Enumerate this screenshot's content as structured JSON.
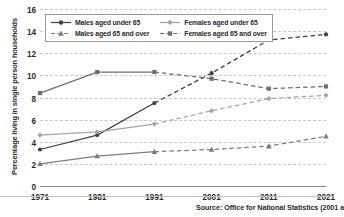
{
  "chart_data": {
    "type": "line",
    "title": "",
    "xlabel": "",
    "ylabel": "Percentage living in single person households",
    "categories": [
      "1971",
      "1981",
      "1991",
      "2001",
      "2011",
      "2021"
    ],
    "x": [
      1971,
      1981,
      1991,
      2001,
      2011,
      2021
    ],
    "ylim": [
      0,
      16
    ],
    "yticks": [
      "0",
      "2",
      "4",
      "6",
      "8",
      "10",
      "12",
      "14",
      "16"
    ],
    "ytick_values": [
      0,
      2,
      4,
      6,
      8,
      10,
      12,
      14,
      16
    ],
    "grid": true,
    "legend_position": "top-left",
    "note": "Solid line segments cover 1971-1991 (observed); dashed segments cover 1991-2021 (projected).",
    "series": [
      {
        "name": "Males aged under 65",
        "marker": "circle",
        "color": "#3f3f3f",
        "values": [
          3.3,
          4.6,
          7.5,
          10.2,
          13.2,
          13.7
        ]
      },
      {
        "name": "Males aged 65 and over",
        "marker": "triangle",
        "color": "#7d7d7d",
        "values": [
          2.0,
          2.7,
          3.1,
          3.3,
          3.6,
          4.5
        ]
      },
      {
        "name": "Females aged under 65",
        "marker": "diamond",
        "color": "#a5a5a5",
        "values": [
          4.6,
          4.9,
          5.6,
          6.8,
          7.9,
          8.2
        ]
      },
      {
        "name": "Females aged 65 and over",
        "marker": "square",
        "color": "#6e6e6e",
        "values": [
          8.4,
          10.3,
          10.3,
          9.7,
          8.8,
          9.0
        ]
      }
    ]
  },
  "legend": {
    "items": [
      {
        "label": "Males aged under 65"
      },
      {
        "label": "Females aged under 65"
      },
      {
        "label": "Males aged 65 and over"
      },
      {
        "label": "Females aged 65 and over"
      }
    ]
  },
  "source": {
    "text": "Source: Office for National Statistics (2001 a"
  }
}
